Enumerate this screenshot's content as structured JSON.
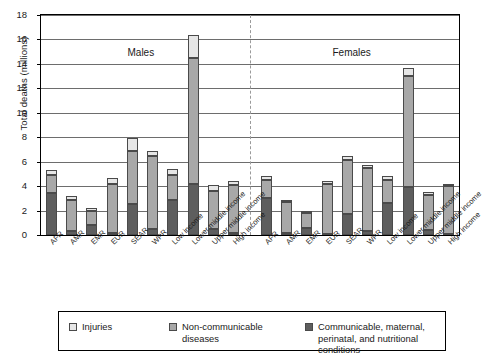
{
  "chart_data": {
    "type": "bar",
    "title": "",
    "xlabel": "",
    "ylabel": "Total deaths (millions)",
    "ylim": [
      0,
      18
    ],
    "ytick_step": 2,
    "yticks": [
      0,
      2,
      4,
      6,
      8,
      10,
      12,
      14,
      16,
      18
    ],
    "grid": true,
    "stacked": true,
    "legend_position": "bottom",
    "panel_labels": [
      "Males",
      "Females"
    ],
    "categories": [
      "AFR",
      "AMR",
      "EMR",
      "EUR",
      "SEAR",
      "WPR",
      "Low income",
      "Lower middle income",
      "Upper middle income",
      "High income"
    ],
    "series": [
      {
        "name": "Communicable, maternal, perinatal, and nutritional conditions",
        "color": "#5e5e5e",
        "males": [
          3.4,
          0.3,
          0.8,
          0.2,
          2.5,
          0.5,
          2.9,
          4.2,
          0.5,
          0.2
        ],
        "females": [
          3.0,
          0.2,
          0.6,
          0.1,
          1.7,
          0.3,
          2.6,
          3.9,
          0.4,
          0.1
        ]
      },
      {
        "name": "Non-communicable diseases",
        "color": "#a8a8a8",
        "males": [
          1.5,
          2.6,
          1.2,
          4.0,
          4.4,
          6.0,
          2.0,
          10.3,
          3.1,
          3.9
        ],
        "females": [
          1.5,
          2.5,
          1.2,
          4.1,
          4.4,
          5.2,
          1.9,
          9.1,
          2.9,
          3.9
        ]
      },
      {
        "name": "Injuries",
        "color": "#e6e6e6",
        "males": [
          0.4,
          0.3,
          0.2,
          0.5,
          1.0,
          0.4,
          0.5,
          1.9,
          0.5,
          0.3
        ],
        "females": [
          0.3,
          0.2,
          0.1,
          0.2,
          0.4,
          0.2,
          0.3,
          0.7,
          0.2,
          0.2
        ]
      }
    ],
    "totals": {
      "males": [
        5.3,
        3.2,
        2.2,
        4.7,
        7.9,
        6.9,
        5.4,
        16.4,
        4.1,
        4.4
      ],
      "females": [
        4.8,
        2.9,
        1.9,
        4.4,
        6.5,
        5.7,
        4.8,
        13.7,
        3.5,
        4.2
      ]
    }
  },
  "legend": {
    "items": [
      {
        "label": "Injuries",
        "swatch": "injuries-swatch"
      },
      {
        "label": "Non-communicable diseases",
        "swatch": "noncommunicable-swatch"
      },
      {
        "label": "Communicable, maternal, perinatal, and nutritional conditions",
        "swatch": "communicable-swatch"
      }
    ]
  }
}
